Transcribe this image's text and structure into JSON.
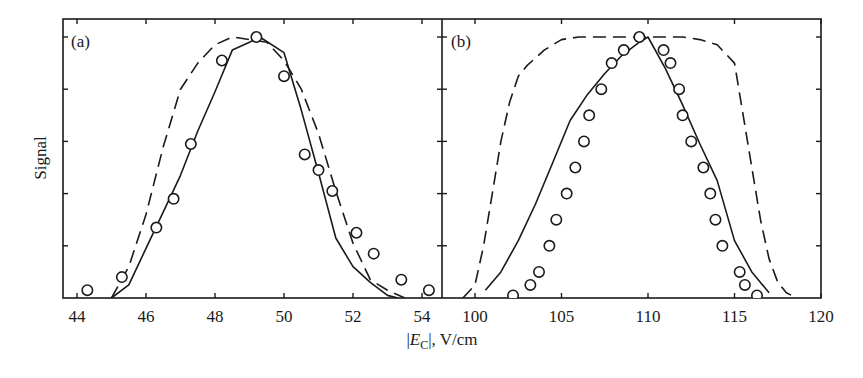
{
  "figure": {
    "ylabel": "Signal",
    "xlabel_prefix": "|",
    "xlabel_var": "E",
    "xlabel_sub": "C",
    "xlabel_suffix": "|, V/cm",
    "ink_color": "#1a1a1a"
  },
  "chart_data": [
    {
      "type": "line",
      "panel_label": "(a)",
      "title": "",
      "xlabel": "|E_C|, V/cm",
      "ylabel": "Signal",
      "xlim": [
        43.6,
        54.6
      ],
      "ylim": [
        0,
        1.05
      ],
      "xticks": [
        44,
        46,
        48,
        50,
        52,
        54
      ],
      "yticks": [
        0,
        0.2,
        0.4,
        0.6,
        0.8,
        1.0
      ],
      "ytick_labels_shown": false,
      "grid": false,
      "series": [
        {
          "name": "experiment",
          "style": "circles",
          "x": [
            44.3,
            45.3,
            46.3,
            46.8,
            47.3,
            48.2,
            49.2,
            50.0,
            50.6,
            51.0,
            51.4,
            52.1,
            52.6,
            53.4,
            54.2
          ],
          "y": [
            0.03,
            0.08,
            0.27,
            0.38,
            0.59,
            0.91,
            1.0,
            0.85,
            0.55,
            0.49,
            0.41,
            0.25,
            0.17,
            0.07,
            0.03
          ]
        },
        {
          "name": "calculation (solid)",
          "style": "solid",
          "x": [
            45.0,
            45.5,
            46.0,
            46.5,
            47.0,
            47.5,
            48.0,
            48.5,
            49.0,
            49.3,
            50.0,
            50.5,
            51.0,
            51.5,
            52.0,
            52.5,
            53.0,
            53.3
          ],
          "y": [
            0.0,
            0.05,
            0.19,
            0.33,
            0.47,
            0.64,
            0.79,
            0.95,
            0.98,
            1.0,
            0.94,
            0.72,
            0.48,
            0.23,
            0.12,
            0.06,
            0.01,
            0.0
          ]
        },
        {
          "name": "calculation (dashed)",
          "style": "dashed",
          "x": [
            45.0,
            45.5,
            46.0,
            46.5,
            47.0,
            47.5,
            48.0,
            48.5,
            49.0,
            49.5,
            50.0,
            50.5,
            51.0,
            51.5,
            52.0,
            52.5,
            53.0,
            53.5
          ],
          "y": [
            0.0,
            0.12,
            0.32,
            0.58,
            0.8,
            0.9,
            0.97,
            1.0,
            0.99,
            0.98,
            0.91,
            0.8,
            0.63,
            0.41,
            0.21,
            0.07,
            0.03,
            0.0
          ]
        }
      ]
    },
    {
      "type": "line",
      "panel_label": "(b)",
      "title": "",
      "xlabel": "|E_C|, V/cm",
      "ylabel": "Signal",
      "xlim": [
        98.1,
        120
      ],
      "ylim": [
        0,
        1.05
      ],
      "xticks": [
        100,
        105,
        110,
        115,
        120
      ],
      "yticks": [
        0,
        0.2,
        0.4,
        0.6,
        0.8,
        1.0
      ],
      "ytick_labels_shown": false,
      "grid": false,
      "series": [
        {
          "name": "experiment",
          "style": "circles",
          "x": [
            102.2,
            103.2,
            103.7,
            104.3,
            104.7,
            105.3,
            105.8,
            106.3,
            106.6,
            107.3,
            107.9,
            108.6,
            109.5,
            110.9,
            111.3,
            111.8,
            112.0,
            112.5,
            113.2,
            113.6,
            113.9,
            114.3,
            115.3,
            115.6,
            116.3
          ],
          "y": [
            0.01,
            0.05,
            0.1,
            0.2,
            0.3,
            0.4,
            0.5,
            0.6,
            0.7,
            0.8,
            0.9,
            0.95,
            1.0,
            0.95,
            0.9,
            0.8,
            0.7,
            0.6,
            0.5,
            0.4,
            0.3,
            0.2,
            0.1,
            0.05,
            0.01
          ]
        },
        {
          "name": "calculation (solid)",
          "style": "solid",
          "x": [
            100.6,
            101.5,
            102.5,
            103.5,
            104.5,
            105.5,
            106.5,
            107.5,
            108.5,
            109.5,
            110.0,
            111.0,
            112.0,
            113.0,
            114.0,
            115.0,
            116.0,
            117.0
          ],
          "y": [
            0.03,
            0.1,
            0.22,
            0.36,
            0.52,
            0.68,
            0.78,
            0.86,
            0.93,
            0.98,
            1.0,
            0.88,
            0.74,
            0.59,
            0.45,
            0.22,
            0.1,
            0.02
          ]
        },
        {
          "name": "calculation (dashed)",
          "style": "dashed",
          "x": [
            99.3,
            100.0,
            100.5,
            101.0,
            101.5,
            102.0,
            102.5,
            103.0,
            104.0,
            105.0,
            106.0,
            108.0,
            110.0,
            112.0,
            113.0,
            114.0,
            115.0,
            115.5,
            116.0,
            116.5,
            117.0,
            117.5,
            118.0,
            118.6
          ],
          "y": [
            0.0,
            0.05,
            0.2,
            0.4,
            0.6,
            0.75,
            0.85,
            0.89,
            0.95,
            0.99,
            1.0,
            1.0,
            1.0,
            1.0,
            0.99,
            0.97,
            0.9,
            0.7,
            0.5,
            0.3,
            0.15,
            0.06,
            0.02,
            0.0
          ]
        }
      ]
    }
  ]
}
